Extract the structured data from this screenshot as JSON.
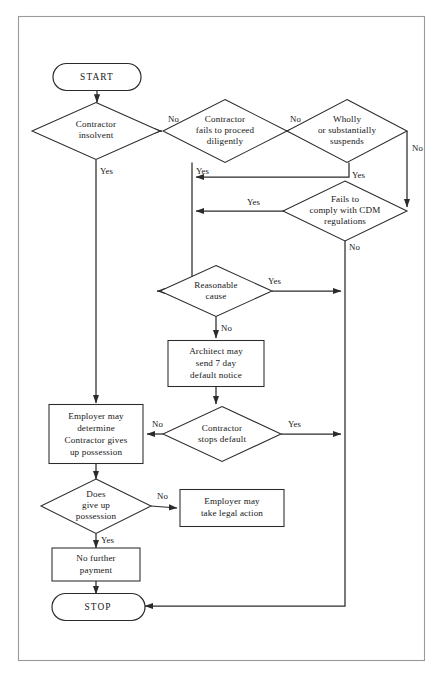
{
  "document": {
    "title": "Contract Termination Flowchart",
    "frame_color": "#9a9a9a",
    "line_color": "#2b2b2b",
    "text_color": "#161616",
    "background_color": "#ffffff"
  },
  "chart_data": {
    "type": "diagram",
    "diagram_kind": "flowchart",
    "nodes": [
      {
        "id": "start",
        "shape": "terminator",
        "label": "START",
        "cx": 97,
        "cy": 77,
        "w": 88,
        "h": 27
      },
      {
        "id": "insolvent",
        "shape": "diamond",
        "label": "Contractor\ninsolvent",
        "cx": 96,
        "cy": 131,
        "w": 128,
        "h": 57
      },
      {
        "id": "diligently",
        "shape": "diamond",
        "label": "Contractor\nfails to proceed\ndiligently",
        "cx": 225,
        "cy": 131,
        "w": 124,
        "h": 63
      },
      {
        "id": "suspends",
        "shape": "diamond",
        "label": "Wholly\nor substantially\nsuspends",
        "cx": 347,
        "cy": 131,
        "w": 120,
        "h": 63
      },
      {
        "id": "cdm",
        "shape": "diamond",
        "label": "Fails to\ncomply with CDM\nregulations",
        "cx": 345,
        "cy": 211,
        "w": 112,
        "h": 60
      },
      {
        "id": "reasonable",
        "shape": "diamond",
        "label": "Reasonable\ncause",
        "cx": 216,
        "cy": 291,
        "w": 112,
        "h": 51
      },
      {
        "id": "architect",
        "shape": "rect",
        "label": "Architect may\nsend 7 day\ndefault notice",
        "cx": 216,
        "cy": 364,
        "w": 96,
        "h": 46
      },
      {
        "id": "stops_default",
        "shape": "diamond",
        "label": "Contractor\nstops default",
        "cx": 222,
        "cy": 434,
        "w": 118,
        "h": 55
      },
      {
        "id": "employer_det",
        "shape": "rect",
        "label": "Employer may\ndetermine\nContractor gives\nup possession",
        "cx": 96,
        "cy": 434,
        "w": 94,
        "h": 59
      },
      {
        "id": "give_up",
        "shape": "diamond",
        "label": "Does\ngive up\npossession",
        "cx": 96,
        "cy": 506,
        "w": 110,
        "h": 55
      },
      {
        "id": "legal_action",
        "shape": "rect",
        "label": "Employer may\ntake legal action",
        "cx": 232,
        "cy": 508,
        "w": 104,
        "h": 37
      },
      {
        "id": "no_payment",
        "shape": "rect",
        "label": "No further\npayment",
        "cx": 96,
        "cy": 564,
        "w": 88,
        "h": 33
      },
      {
        "id": "stop",
        "shape": "terminator",
        "label": "STOP",
        "cx": 96,
        "cy": 607,
        "w": 88,
        "h": 27
      }
    ],
    "edges": [
      {
        "id": "e-start-insolvent",
        "from": "start",
        "to": "insolvent",
        "label": "",
        "label_x": 0,
        "label_y": 0
      },
      {
        "id": "e-insolvent-no",
        "from": "insolvent",
        "to": "diligently",
        "label": "No",
        "label_x": 168,
        "label_y": 122
      },
      {
        "id": "e-insolvent-yes",
        "from": "insolvent",
        "to": "employer_det",
        "label": "Yes",
        "label_x": 100,
        "label_y": 174
      },
      {
        "id": "e-diligently-no",
        "from": "diligently",
        "to": "suspends",
        "label": "No",
        "label_x": 290,
        "label_y": 122
      },
      {
        "id": "e-diligently-yes",
        "from": "diligently",
        "to": "reasonable",
        "label": "Yes",
        "label_x": 196,
        "label_y": 174
      },
      {
        "id": "e-suspends-yes",
        "from": "suspends",
        "to": "diligently",
        "label": "Yes",
        "label_x": 352,
        "label_y": 178
      },
      {
        "id": "e-suspends-no",
        "from": "suspends",
        "to": "cdm",
        "label": "No",
        "label_x": 418,
        "label_y": 151
      },
      {
        "id": "e-cdm-yes",
        "from": "cdm",
        "to": "diligently",
        "label": "Yes",
        "label_x": 250,
        "label_y": 205
      },
      {
        "id": "e-cdm-no",
        "from": "cdm",
        "to": "stop",
        "label": "No",
        "label_x": 350,
        "label_y": 250
      },
      {
        "id": "e-reasonable-yes",
        "from": "reasonable",
        "to": "cdm_rail",
        "label": "Yes",
        "label_x": 271,
        "label_y": 284
      },
      {
        "id": "e-reasonable-no",
        "from": "reasonable",
        "to": "architect",
        "label": "No",
        "label_x": 222,
        "label_y": 330
      },
      {
        "id": "e-architect-stops",
        "from": "architect",
        "to": "stops_default",
        "label": "",
        "label_x": 0,
        "label_y": 0
      },
      {
        "id": "e-stops-no",
        "from": "stops_default",
        "to": "employer_det",
        "label": "No",
        "label_x": 155,
        "label_y": 427
      },
      {
        "id": "e-stops-yes",
        "from": "stops_default",
        "to": "cdm_rail",
        "label": "Yes",
        "label_x": 290,
        "label_y": 427
      },
      {
        "id": "e-employer-giveup",
        "from": "employer_det",
        "to": "give_up",
        "label": "",
        "label_x": 0,
        "label_y": 0
      },
      {
        "id": "e-giveup-no",
        "from": "give_up",
        "to": "legal_action",
        "label": "No",
        "label_x": 160,
        "label_y": 499
      },
      {
        "id": "e-giveup-yes",
        "from": "give_up",
        "to": "no_payment",
        "label": "Yes",
        "label_x": 102,
        "label_y": 542
      },
      {
        "id": "e-payment-stop",
        "from": "no_payment",
        "to": "stop",
        "label": "",
        "label_x": 0,
        "label_y": 0
      }
    ],
    "labels_unique": [
      "START",
      "STOP",
      "Yes",
      "No"
    ],
    "frame": {
      "x": 18,
      "y": 16,
      "w": 407,
      "h": 645
    }
  }
}
